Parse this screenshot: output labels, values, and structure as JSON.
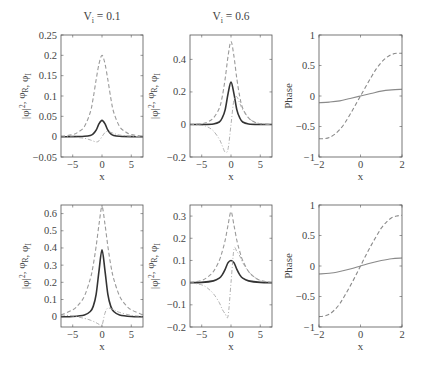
{
  "figure": {
    "width": 422,
    "height": 368,
    "colors": {
      "axis": "#555555",
      "solid_dark": "#333333",
      "dashed": "#9a9a9a",
      "dashdot": "#a8a8a8",
      "phase_solid": "#8a8a8a",
      "phase_dashed": "#8a8a8a"
    }
  },
  "chart_data": [
    {
      "id": "top-left",
      "type": "line",
      "title": "V_i = 0.1",
      "title_main": "V",
      "title_sub": "i",
      "title_rest": " = 0.1",
      "xlabel": "x",
      "ylabel": "|φ|², φ_R, φ_I",
      "xlim": [
        -7,
        7
      ],
      "ylim": [
        -0.05,
        0.25
      ],
      "xticks": [
        -5,
        0,
        5
      ],
      "yticks": [
        -0.05,
        0,
        0.05,
        0.1,
        0.15,
        0.2,
        0.25
      ],
      "ytick_labels": [
        "−0.05",
        "0",
        "0.05",
        "0.1",
        "0.15",
        "0.2",
        "0.25"
      ],
      "box": {
        "x0": 61,
        "x1": 143,
        "y0": 35,
        "y1": 157
      },
      "series": [
        {
          "name": "|φ|²",
          "style": "solid-dark",
          "x": [
            -7,
            -5,
            -3,
            -2,
            -1.5,
            -1,
            -0.5,
            0,
            0.5,
            1,
            1.5,
            2,
            3,
            5,
            7
          ],
          "y": [
            0,
            0,
            0.001,
            0.003,
            0.007,
            0.016,
            0.032,
            0.04,
            0.032,
            0.016,
            0.007,
            0.003,
            0.001,
            0,
            0
          ]
        },
        {
          "name": "φ_R",
          "style": "dashed",
          "x": [
            -7,
            -5,
            -4,
            -3,
            -2,
            -1.5,
            -1,
            -0.5,
            0,
            0.5,
            1,
            1.5,
            2,
            3,
            4,
            5,
            7
          ],
          "y": [
            0.001,
            0.005,
            0.012,
            0.025,
            0.06,
            0.095,
            0.14,
            0.18,
            0.2,
            0.18,
            0.14,
            0.095,
            0.06,
            0.025,
            0.012,
            0.005,
            0.001
          ]
        },
        {
          "name": "φ_I",
          "style": "dashdot",
          "x": [
            -7,
            -5,
            -3,
            -2,
            -1,
            -0.5,
            0,
            0.5,
            1,
            2,
            3,
            5,
            7
          ],
          "y": [
            0,
            -0.001,
            -0.004,
            -0.008,
            -0.013,
            -0.01,
            0,
            0.01,
            0.013,
            0.008,
            0.004,
            0.001,
            0
          ]
        }
      ]
    },
    {
      "id": "top-middle",
      "type": "line",
      "title": "V_i = 0.6",
      "title_main": "V",
      "title_sub": "i",
      "title_rest": " = 0.6",
      "xlabel": "x",
      "ylabel": "|φ|², φ_R, φ_I",
      "xlim": [
        -7,
        7
      ],
      "ylim": [
        -0.2,
        0.55
      ],
      "xticks": [
        -5,
        0,
        5
      ],
      "yticks": [
        -0.2,
        0,
        0.2,
        0.4
      ],
      "ytick_labels": [
        "−0.2",
        "0",
        "0.2",
        "0.4"
      ],
      "box": {
        "x0": 190,
        "x1": 272,
        "y0": 35,
        "y1": 157
      },
      "series": [
        {
          "name": "|φ|²",
          "style": "solid-dark",
          "x": [
            -7,
            -5,
            -3,
            -2,
            -1.5,
            -1,
            -0.5,
            0,
            0.5,
            1,
            1.5,
            2,
            3,
            5,
            7
          ],
          "y": [
            0,
            0,
            0.003,
            0.015,
            0.04,
            0.09,
            0.19,
            0.26,
            0.19,
            0.09,
            0.04,
            0.015,
            0.003,
            0,
            0
          ]
        },
        {
          "name": "φ_R",
          "style": "dashed",
          "x": [
            -7,
            -5,
            -4,
            -3,
            -2,
            -1.5,
            -1,
            -0.5,
            0,
            0.5,
            1,
            1.5,
            2,
            3,
            4,
            5,
            7
          ],
          "y": [
            0,
            0.005,
            0.015,
            0.04,
            0.1,
            0.17,
            0.28,
            0.42,
            0.51,
            0.42,
            0.28,
            0.17,
            0.1,
            0.04,
            0.015,
            0.005,
            0
          ]
        },
        {
          "name": "φ_I",
          "style": "dashdot",
          "x": [
            -7,
            -5,
            -4,
            -3,
            -2,
            -1.5,
            -1,
            -0.5,
            0,
            0.5,
            1,
            1.5,
            2,
            3,
            4,
            5,
            7
          ],
          "y": [
            0,
            -0.005,
            -0.015,
            -0.04,
            -0.09,
            -0.13,
            -0.17,
            -0.15,
            0,
            0.15,
            0.17,
            0.13,
            0.09,
            0.04,
            0.015,
            0.005,
            0
          ]
        }
      ]
    },
    {
      "id": "top-right",
      "type": "line",
      "title": "",
      "xlabel": "x",
      "ylabel": "Phase",
      "xlim": [
        -2,
        2
      ],
      "ylim": [
        -1,
        1
      ],
      "xticks": [
        -2,
        0,
        2
      ],
      "yticks": [
        -1,
        -0.5,
        0,
        0.5,
        1
      ],
      "ytick_labels": [
        "−1",
        "−0.5",
        "0",
        "0.5",
        "1"
      ],
      "box": {
        "x0": 319,
        "x1": 402,
        "y0": 35,
        "y1": 157
      },
      "series": [
        {
          "name": "phase-solid",
          "style": "phase-solid",
          "x": [
            -2,
            -1.5,
            -1,
            -0.5,
            0,
            0.5,
            1,
            1.5,
            2
          ],
          "y": [
            -0.11,
            -0.1,
            -0.08,
            -0.04,
            0,
            0.04,
            0.08,
            0.1,
            0.11
          ]
        },
        {
          "name": "phase-dashed",
          "style": "phase-dashed",
          "x": [
            -2,
            -1.75,
            -1.5,
            -1.25,
            -1,
            -0.75,
            -0.5,
            -0.25,
            0,
            0.25,
            0.5,
            0.75,
            1,
            1.25,
            1.5,
            1.75,
            2
          ],
          "y": [
            -0.7,
            -0.7,
            -0.68,
            -0.63,
            -0.55,
            -0.44,
            -0.3,
            -0.15,
            0,
            0.15,
            0.3,
            0.44,
            0.55,
            0.63,
            0.68,
            0.7,
            0.7
          ]
        }
      ]
    },
    {
      "id": "bottom-left",
      "type": "line",
      "title": "",
      "xlabel": "x",
      "ylabel": "|φ|², φ_R, φ_I",
      "xlim": [
        -7,
        7
      ],
      "ylim": [
        -0.06,
        0.65
      ],
      "xticks": [
        -5,
        0,
        5
      ],
      "yticks": [
        0,
        0.1,
        0.2,
        0.3,
        0.4,
        0.5,
        0.6
      ],
      "ytick_labels": [
        "0",
        "0.1",
        "0.2",
        "0.3",
        "0.4",
        "0.5",
        "0.6"
      ],
      "box": {
        "x0": 61,
        "x1": 143,
        "y0": 205,
        "y1": 327
      },
      "series": [
        {
          "name": "|φ|²",
          "style": "solid-dark",
          "x": [
            -7,
            -5,
            -3,
            -2,
            -1.5,
            -1,
            -0.5,
            0,
            0.5,
            1,
            1.5,
            2,
            3,
            5,
            7
          ],
          "y": [
            0,
            0.001,
            0.01,
            0.03,
            0.06,
            0.13,
            0.27,
            0.39,
            0.27,
            0.13,
            0.06,
            0.03,
            0.01,
            0.001,
            0
          ]
        },
        {
          "name": "φ_R",
          "style": "dashed",
          "x": [
            -7,
            -5,
            -4,
            -3,
            -2,
            -1.5,
            -1,
            -0.5,
            0,
            0.5,
            1,
            1.5,
            2,
            3,
            4,
            5,
            7
          ],
          "y": [
            0.01,
            0.04,
            0.07,
            0.12,
            0.22,
            0.3,
            0.41,
            0.54,
            0.64,
            0.54,
            0.41,
            0.3,
            0.22,
            0.12,
            0.07,
            0.04,
            0.01
          ]
        },
        {
          "name": "φ_I",
          "style": "dashdot",
          "x": [
            -7,
            -5,
            -3,
            -2,
            -1,
            -0.5,
            0,
            0.5,
            1,
            2,
            3,
            5,
            7
          ],
          "y": [
            0.01,
            0.004,
            -0.01,
            -0.02,
            -0.035,
            -0.045,
            -0.05,
            0.02,
            0.05,
            0.04,
            0.025,
            0.008,
            0.002
          ]
        }
      ]
    },
    {
      "id": "bottom-middle",
      "type": "line",
      "title": "",
      "xlabel": "x",
      "ylabel": "|φ|², φ_R, φ_I",
      "xlim": [
        -7,
        7
      ],
      "ylim": [
        -0.2,
        0.35
      ],
      "xticks": [
        -5,
        0,
        5
      ],
      "yticks": [
        -0.2,
        -0.1,
        0,
        0.1,
        0.2,
        0.3
      ],
      "ytick_labels": [
        "−0.2",
        "−0.1",
        "0",
        "0.1",
        "0.2",
        "0.3"
      ],
      "box": {
        "x0": 190,
        "x1": 272,
        "y0": 205,
        "y1": 327
      },
      "series": [
        {
          "name": "|φ|²",
          "style": "solid-dark",
          "x": [
            -7,
            -5,
            -3,
            -2,
            -1.5,
            -1,
            -0.5,
            0,
            0.5,
            1,
            1.5,
            2,
            3,
            5,
            7
          ],
          "y": [
            0,
            0.001,
            0.008,
            0.02,
            0.035,
            0.06,
            0.09,
            0.1,
            0.09,
            0.06,
            0.035,
            0.02,
            0.008,
            0.001,
            0
          ]
        },
        {
          "name": "φ_R",
          "style": "dashed",
          "x": [
            -7,
            -5,
            -4,
            -3,
            -2,
            -1.5,
            -1,
            -0.5,
            0,
            0.5,
            1,
            1.5,
            2,
            3,
            4,
            5,
            7
          ],
          "y": [
            0,
            0.01,
            0.025,
            0.05,
            0.1,
            0.14,
            0.19,
            0.26,
            0.32,
            0.26,
            0.19,
            0.14,
            0.1,
            0.05,
            0.025,
            0.01,
            0
          ]
        },
        {
          "name": "φ_I",
          "style": "dashdot",
          "x": [
            -7,
            -5,
            -4,
            -3,
            -2,
            -1.5,
            -1,
            -0.5,
            0,
            0.5,
            1,
            1.5,
            2,
            3,
            4,
            5,
            7
          ],
          "y": [
            0,
            -0.01,
            -0.025,
            -0.05,
            -0.09,
            -0.12,
            -0.14,
            -0.15,
            0,
            0.15,
            0.14,
            0.12,
            0.09,
            0.05,
            0.025,
            0.01,
            0
          ]
        }
      ]
    },
    {
      "id": "bottom-right",
      "type": "line",
      "title": "",
      "xlabel": "x",
      "ylabel": "Phase",
      "xlim": [
        -2,
        2
      ],
      "ylim": [
        -1,
        1
      ],
      "xticks": [
        -2,
        0,
        2
      ],
      "yticks": [
        -1,
        -0.5,
        0,
        0.5,
        1
      ],
      "ytick_labels": [
        "−1",
        "−0.5",
        "0",
        "0.5",
        "1"
      ],
      "box": {
        "x0": 319,
        "x1": 402,
        "y0": 205,
        "y1": 327
      },
      "series": [
        {
          "name": "phase-solid",
          "style": "phase-solid",
          "x": [
            -2,
            -1.5,
            -1,
            -0.5,
            0,
            0.5,
            1,
            1.5,
            2
          ],
          "y": [
            -0.13,
            -0.12,
            -0.09,
            -0.05,
            0,
            0.05,
            0.09,
            0.12,
            0.13
          ]
        },
        {
          "name": "phase-dashed",
          "style": "phase-dashed",
          "x": [
            -2,
            -1.75,
            -1.5,
            -1.25,
            -1,
            -0.75,
            -0.5,
            -0.25,
            0,
            0.25,
            0.5,
            0.75,
            1,
            1.25,
            1.5,
            1.75,
            2
          ],
          "y": [
            -0.83,
            -0.82,
            -0.79,
            -0.72,
            -0.62,
            -0.48,
            -0.33,
            -0.17,
            0,
            0.17,
            0.33,
            0.48,
            0.62,
            0.72,
            0.79,
            0.82,
            0.83
          ]
        }
      ]
    }
  ]
}
